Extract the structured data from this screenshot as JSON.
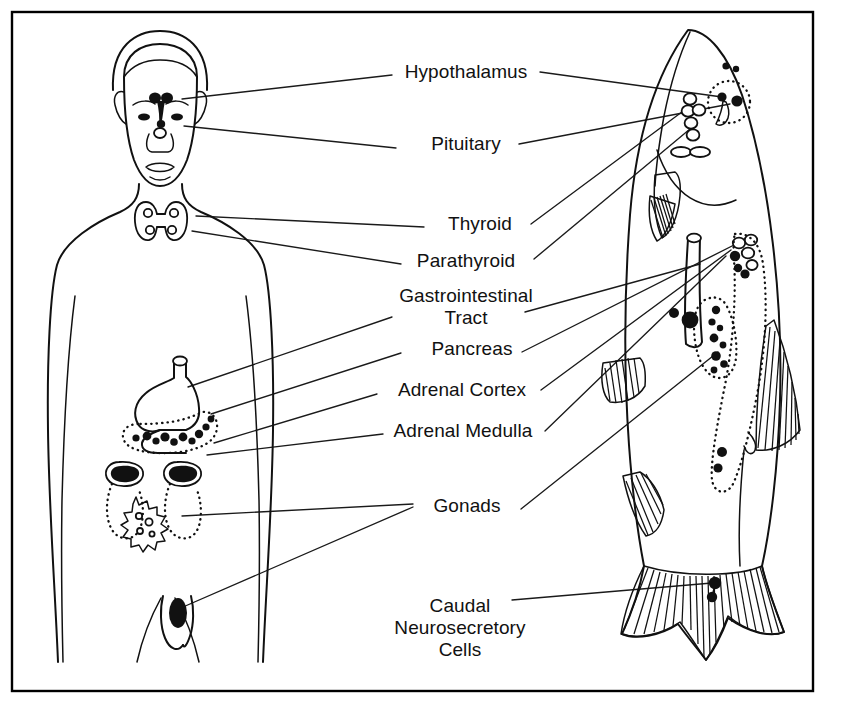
{
  "figure": {
    "border_color": "#000000",
    "ink_color": "#111111",
    "background_color": "#ffffff"
  },
  "labels": [
    {
      "id": "hypothalamus",
      "text": "Hypothalamus",
      "x": 466,
      "y": 78,
      "lines": [
        "Hypothalamus"
      ]
    },
    {
      "id": "pituitary",
      "text": "Pituitary",
      "x": 466,
      "y": 150,
      "lines": [
        "Pituitary"
      ]
    },
    {
      "id": "thyroid",
      "text": "Thyroid",
      "x": 480,
      "y": 230,
      "lines": [
        "Thyroid"
      ]
    },
    {
      "id": "parathyroid",
      "text": "Parathyroid",
      "x": 466,
      "y": 267,
      "lines": [
        "Parathyroid"
      ]
    },
    {
      "id": "gi-tract",
      "text": "Gastrointestinal Tract",
      "x": 466,
      "y": 302,
      "lines": [
        "Gastrointestinal",
        "Tract"
      ]
    },
    {
      "id": "pancreas",
      "text": "Pancreas",
      "x": 472,
      "y": 355,
      "lines": [
        "Pancreas"
      ]
    },
    {
      "id": "adrenal-cortex",
      "text": "Adrenal Cortex",
      "x": 462,
      "y": 396,
      "lines": [
        "Adrenal Cortex"
      ]
    },
    {
      "id": "adrenal-medulla",
      "text": "Adrenal Medulla",
      "x": 463,
      "y": 437,
      "lines": [
        "Adrenal Medulla"
      ]
    },
    {
      "id": "gonads",
      "text": "Gonads",
      "x": 467,
      "y": 512,
      "lines": [
        "Gonads"
      ]
    },
    {
      "id": "caudal-cells",
      "text": "Caudal Neurosecretory Cells",
      "x": 460,
      "y": 612,
      "lines": [
        "Caudal",
        "Neurosecretory",
        "Cells"
      ]
    }
  ],
  "organisms": [
    {
      "id": "human",
      "name": "Human figure",
      "side": "left",
      "glands": [
        {
          "id": "human-hypothalamus",
          "name": "Hypothalamus"
        },
        {
          "id": "human-pituitary",
          "name": "Pituitary"
        },
        {
          "id": "human-thyroid",
          "name": "Thyroid"
        },
        {
          "id": "human-parathyroid",
          "name": "Parathyroid"
        },
        {
          "id": "human-gi-tract",
          "name": "Gastrointestinal Tract"
        },
        {
          "id": "human-pancreas",
          "name": "Pancreas"
        },
        {
          "id": "human-adrenal-cortex",
          "name": "Adrenal Cortex"
        },
        {
          "id": "human-adrenal-medulla",
          "name": "Adrenal Medulla"
        },
        {
          "id": "human-ovary",
          "name": "Gonads (ovary)"
        },
        {
          "id": "human-testis",
          "name": "Gonads (testis)"
        }
      ]
    },
    {
      "id": "fish",
      "name": "Fish figure",
      "side": "right",
      "glands": [
        {
          "id": "fish-hypothalamus",
          "name": "Hypothalamus"
        },
        {
          "id": "fish-pituitary",
          "name": "Pituitary"
        },
        {
          "id": "fish-thyroid",
          "name": "Thyroid"
        },
        {
          "id": "fish-parathyroid",
          "name": "Parathyroid"
        },
        {
          "id": "fish-gi-tract",
          "name": "Gastrointestinal Tract"
        },
        {
          "id": "fish-pancreas",
          "name": "Pancreas"
        },
        {
          "id": "fish-adrenal-cortex",
          "name": "Adrenal Cortex"
        },
        {
          "id": "fish-adrenal-medulla",
          "name": "Adrenal Medulla"
        },
        {
          "id": "fish-gonad",
          "name": "Gonads"
        },
        {
          "id": "fish-caudal-cells",
          "name": "Caudal Neurosecretory Cells"
        }
      ]
    }
  ]
}
